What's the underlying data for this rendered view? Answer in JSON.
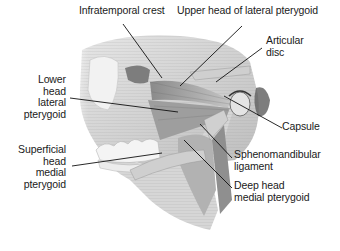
{
  "figure": {
    "colors": {
      "background": "#ffffff",
      "bone": "#d9d9d9",
      "bone_shadow": "#8f8f8f",
      "muscle": "#a8a8a8",
      "muscle_dark": "#6e6e6e",
      "leader_line": "#111111",
      "label_text": "#1a1a1a"
    },
    "labels": [
      {
        "id": "infratemporal-crest",
        "lines": [
          "Infratemporal crest"
        ]
      },
      {
        "id": "upper-head-lateral-pterygoid",
        "lines": [
          "Upper head of lateral pterygoid"
        ]
      },
      {
        "id": "articular-disc",
        "lines": [
          "Articular",
          "disc"
        ]
      },
      {
        "id": "lower-head-lateral-pterygoid",
        "lines": [
          "Lower",
          "head",
          "lateral",
          "pterygoid"
        ]
      },
      {
        "id": "capsule",
        "lines": [
          "Capsule"
        ]
      },
      {
        "id": "superficial-head-medial-pterygoid",
        "lines": [
          "Superficial",
          "head",
          "medial",
          "pterygoid"
        ]
      },
      {
        "id": "sphenomandibular-ligament",
        "lines": [
          "Sphenomandibular",
          "ligament"
        ]
      },
      {
        "id": "deep-head-medial-pterygoid",
        "lines": [
          "Deep head",
          "medial pterygoid"
        ]
      }
    ]
  }
}
